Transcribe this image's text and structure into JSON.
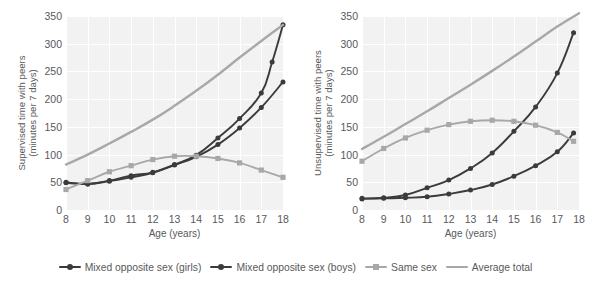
{
  "legend": {
    "position": "bottom-center",
    "items": [
      {
        "label": "Mixed opposite sex (girls)",
        "color": "#3b3b3b",
        "marker": "circle"
      },
      {
        "label": "Mixed opposite sex (boys)",
        "color": "#3b3b3b",
        "marker": "circle"
      },
      {
        "label": "Same sex",
        "color": "#a8a8a8",
        "marker": "square"
      },
      {
        "label": "Average total",
        "color": "#a8a8a8",
        "marker": "line"
      }
    ]
  },
  "chart_data": [
    {
      "type": "line",
      "title": "",
      "panel": "left",
      "xlabel": "Age (years)",
      "ylabel": "Supervised time with peers\n(minutes per 7 days)",
      "x": [
        8,
        9,
        10,
        11,
        12,
        13,
        14,
        15,
        16,
        17,
        18
      ],
      "xticklabels": [
        "8",
        "9",
        "10",
        "11",
        "12",
        "13",
        "14",
        "15",
        "16",
        "17",
        "18"
      ],
      "yticks": [
        0,
        50,
        100,
        150,
        200,
        250,
        300,
        350
      ],
      "ylim": [
        0,
        350
      ],
      "xlim": [
        8,
        18
      ],
      "grid": true,
      "series": [
        {
          "name": "Mixed opposite sex (girls)",
          "color": "#3b3b3b",
          "marker": "circle",
          "values": [
            50,
            47,
            53,
            62,
            68,
            82,
            99,
            130,
            165,
            211,
            267,
            334
          ],
          "x_override": [
            8,
            9,
            10,
            11,
            12,
            13,
            14,
            15,
            16,
            17,
            17.5,
            18
          ]
        },
        {
          "name": "Mixed opposite sex (boys)",
          "color": "#3b3b3b",
          "marker": "circle",
          "values": [
            49,
            47,
            52,
            59,
            67,
            81,
            96,
            118,
            148,
            185,
            231
          ],
          "x_override": [
            8,
            9,
            10,
            11,
            12,
            13,
            14,
            15,
            16,
            17,
            18
          ]
        },
        {
          "name": "Same sex",
          "color": "#a8a8a8",
          "marker": "square",
          "values": [
            37,
            53,
            69,
            80,
            91,
            97,
            97,
            93,
            85,
            72,
            59
          ],
          "x_override": [
            8,
            9,
            10,
            11,
            12,
            13,
            14,
            15,
            16,
            17,
            18
          ]
        },
        {
          "name": "Average total",
          "color": "#a8a8a8",
          "marker": "line",
          "values": [
            82,
            100,
            120,
            141,
            163,
            188,
            215,
            244,
            275,
            305,
            334
          ],
          "x_override": [
            8,
            9,
            10,
            11,
            12,
            13,
            14,
            15,
            16,
            17,
            18
          ]
        }
      ]
    },
    {
      "type": "line",
      "title": "",
      "panel": "right",
      "xlabel": "Age (years)",
      "ylabel": "Unsupervised time with peers\n(minutes per 7 days)",
      "x": [
        8,
        9,
        10,
        11,
        12,
        13,
        14,
        15,
        16,
        17,
        18
      ],
      "xticklabels": [
        "8",
        "9",
        "10",
        "11",
        "12",
        "13",
        "14",
        "15",
        "16",
        "17",
        "18"
      ],
      "yticks": [
        0,
        50,
        100,
        150,
        200,
        250,
        300,
        350
      ],
      "ylim": [
        0,
        350
      ],
      "xlim": [
        8,
        18
      ],
      "grid": true,
      "series": [
        {
          "name": "Mixed opposite sex (girls)",
          "color": "#3b3b3b",
          "marker": "circle",
          "values": [
            21,
            22,
            27,
            40,
            54,
            75,
            103,
            142,
            186,
            247,
            320
          ],
          "x_override": [
            8,
            9,
            10,
            11,
            12,
            13,
            14,
            15,
            16,
            17,
            17.75
          ]
        },
        {
          "name": "Mixed opposite sex (boys)",
          "color": "#3b3b3b",
          "marker": "circle",
          "values": [
            20,
            21,
            22,
            24,
            29,
            36,
            46,
            61,
            80,
            105,
            139
          ],
          "x_override": [
            8,
            9,
            10,
            11,
            12,
            13,
            14,
            15,
            16,
            17,
            17.75
          ]
        },
        {
          "name": "Same sex",
          "color": "#a8a8a8",
          "marker": "square",
          "values": [
            88,
            111,
            130,
            144,
            154,
            160,
            162,
            160,
            153,
            140,
            124
          ],
          "x_override": [
            8,
            9,
            10,
            11,
            12,
            13,
            14,
            15,
            16,
            17,
            17.75
          ]
        },
        {
          "name": "Average total",
          "color": "#a8a8a8",
          "marker": "line",
          "values": [
            110,
            132,
            155,
            178,
            202,
            226,
            251,
            277,
            304,
            331,
            355
          ],
          "x_override": [
            8,
            9,
            10,
            11,
            12,
            13,
            14,
            15,
            16,
            17,
            18
          ]
        }
      ]
    }
  ]
}
